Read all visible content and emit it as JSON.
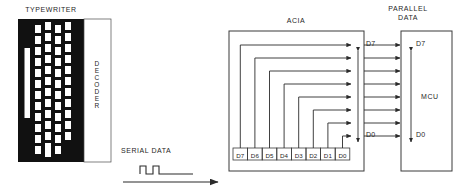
{
  "diagram": {
    "colors": {
      "ink": "#1f1f1f",
      "line": "#3a3a3a",
      "keyboard_body": "#111111",
      "key_fill": "#ffffff",
      "decoder_fill": "#ffffff",
      "page_bg": "#ffffff"
    }
  },
  "typewriter": {
    "caption": "TYPEWRITER",
    "keyboard_label": "KEYBOARD",
    "decoder_label": "DECODER",
    "key_columns": 4,
    "key_rows": 11,
    "spacebar_present": true
  },
  "serial": {
    "label": "SERIAL DATA",
    "waveform_pulses": 2,
    "arrow_direction": "right"
  },
  "acia": {
    "label": "ACIA",
    "register_bits": [
      "D7",
      "D6",
      "D5",
      "D4",
      "D3",
      "D2",
      "D1",
      "D0"
    ],
    "bus_top_label": "D7",
    "bus_bottom_label": "D0",
    "bus_lines": 8
  },
  "parallel": {
    "label_line1": "PARALLEL",
    "label_line2": "DATA",
    "lines": 8
  },
  "mcu": {
    "label": "MCU",
    "bus_top_label": "D7",
    "bus_bottom_label": "D0"
  }
}
